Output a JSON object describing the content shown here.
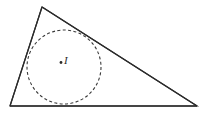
{
  "figure": {
    "background_color": "#ffffff",
    "width": 205,
    "height": 113,
    "stroke_color": "#2b2b2b",
    "circle_stroke_color": "#3a3a3a",
    "point_color": "#2b2b2b"
  },
  "labels": {
    "incenter": "I"
  },
  "chart_data": {
    "type": "diagram",
    "subtype": "euclidean-geometry",
    "xlabel": "",
    "ylabel": "",
    "xlim": [
      0,
      205
    ],
    "ylim": [
      113,
      0
    ],
    "grid": false,
    "legend": null,
    "shapes": [
      {
        "name": "triangle",
        "type": "polygon",
        "style": "solid",
        "stroke": "#2b2b2b",
        "stroke_width": 1.2,
        "fill": "none",
        "vertices": [
          {
            "label": "apex",
            "x": 42,
            "y": 7
          },
          {
            "label": "bottom-left",
            "x": 10,
            "y": 106
          },
          {
            "label": "bottom-right",
            "x": 197,
            "y": 106
          }
        ],
        "sides": [
          {
            "name": "left-side",
            "from": "apex",
            "to": "bottom-left"
          },
          {
            "name": "base",
            "from": "bottom-left",
            "to": "bottom-right"
          },
          {
            "name": "hypotenuse",
            "from": "apex",
            "to": "bottom-right"
          }
        ]
      },
      {
        "name": "inscribed-circle",
        "type": "circle",
        "style": "dashed",
        "stroke": "#3a3a3a",
        "stroke_width": 1.1,
        "dash_pattern": "3,2.4",
        "fill": "none",
        "center": {
          "x": 64,
          "y": 67
        },
        "radius": 37
      },
      {
        "name": "incenter-point",
        "type": "point",
        "x": 61,
        "y": 62.5,
        "radius": 1.4,
        "fill": "#2b2b2b"
      }
    ],
    "annotations": [
      {
        "name": "incenter-label",
        "text": "I",
        "x": 64,
        "y": 62,
        "style": "italic"
      }
    ]
  }
}
